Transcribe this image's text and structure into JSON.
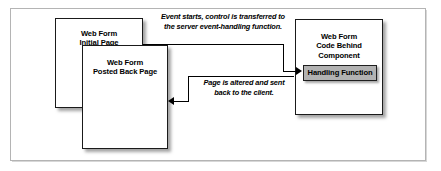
{
  "figure": {
    "boxes": {
      "initial_page": {
        "line1": "Web Form",
        "line2": "Initial Page"
      },
      "posted_back_page": {
        "line1": "Web Form",
        "line2": "Posted Back Page"
      },
      "code_behind": {
        "line1": "Web Form",
        "line2": "Code Behind Component",
        "handling_function": "Handling Function"
      }
    },
    "annotations": {
      "top_arrow": {
        "line1": "Event starts, control is transferred to",
        "line2": "the server event-handling function."
      },
      "bottom_arrow": {
        "line1": "Page is altered and sent",
        "line2": "back to the client."
      }
    },
    "colors": {
      "frame_border": "#b4b4b4",
      "box_border": "#1a1a1a",
      "box_fill": "#ffffff",
      "handling_function_fill": "#b2b2b2",
      "arrow": "#000000",
      "text": "#000000"
    }
  }
}
